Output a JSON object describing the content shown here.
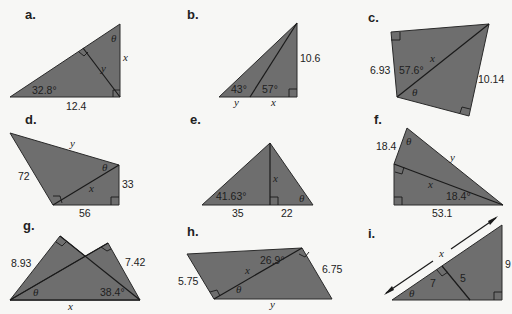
{
  "fill_color": "#6e6e6e",
  "problems": [
    {
      "label": "a.",
      "given": [
        "32.8°",
        "12.4"
      ],
      "unknowns": [
        "x",
        "y",
        "θ"
      ],
      "right_angles": 2
    },
    {
      "label": "b.",
      "given": [
        "43°",
        "57°",
        "10.6"
      ],
      "unknowns": [
        "x",
        "y"
      ],
      "right_angles": 1
    },
    {
      "label": "c.",
      "given": [
        "6.93",
        "57.6°",
        "10.14"
      ],
      "unknowns": [
        "x",
        "θ"
      ],
      "right_angles": 2
    },
    {
      "label": "d.",
      "given": [
        "72",
        "33",
        "56"
      ],
      "unknowns": [
        "x",
        "y",
        "θ"
      ],
      "right_angles": 2
    },
    {
      "label": "e.",
      "given": [
        "41.63°",
        "35",
        "22"
      ],
      "unknowns": [
        "x",
        "θ"
      ],
      "right_angles": 1
    },
    {
      "label": "f.",
      "given": [
        "18.4",
        "18.4°",
        "53.1"
      ],
      "unknowns": [
        "x",
        "y",
        "θ"
      ],
      "right_angles": 2
    },
    {
      "label": "g.",
      "given": [
        "8.93",
        "7.42",
        "38.4°"
      ],
      "unknowns": [
        "x",
        "θ"
      ],
      "right_angles": 2
    },
    {
      "label": "h.",
      "given": [
        "26.9°",
        "5.75",
        "6.75"
      ],
      "unknowns": [
        "x",
        "y",
        "θ"
      ],
      "right_angles": 2
    },
    {
      "label": "i.",
      "given": [
        "7",
        "5",
        "9"
      ],
      "unknowns": [
        "x",
        "θ"
      ],
      "right_angles": 2
    }
  ]
}
